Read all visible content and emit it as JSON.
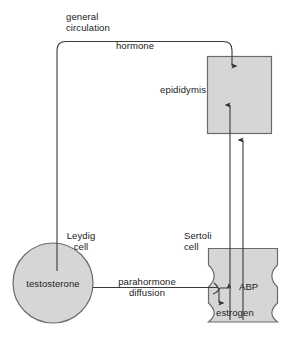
{
  "diagram": {
    "colors": {
      "fill": "#d6d6d6",
      "stroke": "#4a4a4a",
      "line": "#3a3a3a",
      "text": "#1a1a1a",
      "background": "#ffffff"
    },
    "labels": {
      "general_circulation": "general\ncirculation",
      "hormone": "hormone",
      "epididymis": "epididymis",
      "leydig_cell": "Leydig\ncell",
      "sertoli_cell": "Sertoli\ncell",
      "testosterone": "testosterone",
      "parahormone_diffusion": "parahormone\ndiffusion",
      "abp": "ABP",
      "estrogen": "estrogen"
    },
    "nodes": [
      {
        "id": "leydig-cell",
        "shape": "circle",
        "label": "testosterone",
        "caption": "Leydig cell"
      },
      {
        "id": "sertoli-cell",
        "shape": "waisted-column",
        "label": "ABP / estrogen",
        "caption": "Sertoli cell"
      },
      {
        "id": "epididymis",
        "shape": "square",
        "label": "epididymis",
        "caption": "epididymis"
      }
    ],
    "edges": [
      {
        "id": "general-circulation",
        "from": "leydig-cell",
        "to": "epididymis",
        "label": "hormone",
        "style": "rounded-path",
        "arrow": "down"
      },
      {
        "id": "parahormone",
        "from": "leydig-cell",
        "to": "sertoli-cell",
        "label": "parahormone diffusion",
        "style": "straight",
        "arrow": "right-split"
      },
      {
        "id": "abp-transport",
        "from": "sertoli-cell",
        "to": "epididymis",
        "label": "ABP",
        "style": "vertical",
        "arrow": "up"
      },
      {
        "id": "estrogen-transport",
        "from": "sertoli-cell",
        "to": "epididymis",
        "label": "estrogen",
        "style": "vertical",
        "arrow": "up"
      },
      {
        "id": "split-to-abp",
        "from": "parahormone",
        "to": "abp",
        "label": "",
        "style": "short",
        "arrow": "right"
      },
      {
        "id": "split-to-estrogen",
        "from": "parahormone",
        "to": "estrogen",
        "label": "",
        "style": "short",
        "arrow": "down"
      }
    ]
  }
}
